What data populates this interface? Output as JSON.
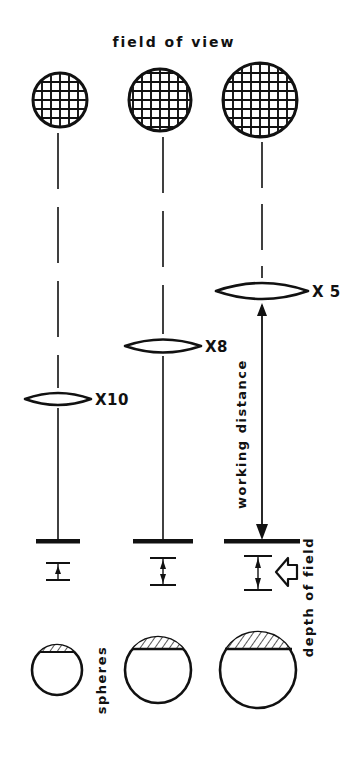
{
  "figure": {
    "title": "field of view",
    "background_color": "#ffffff",
    "ink_color": "#111111",
    "width": 349,
    "height": 758
  },
  "labels": {
    "field_of_view": "field of view",
    "working_distance": "working distance",
    "depth_of_field": "depth of field",
    "spheres": "spheres"
  },
  "columns": [
    {
      "magnification_label": "X10",
      "center_x": 58,
      "field_of_view": {
        "center_x": 60,
        "center_y": 100,
        "radius": 27,
        "grid_pitch": 9
      },
      "lens": {
        "center_x": 58,
        "center_y": 399,
        "half_width": 33,
        "half_height": 9
      },
      "specimen_bar": {
        "center_x": 58,
        "y": 541,
        "half_width": 22,
        "thickness": 4
      },
      "depth_of_field": {
        "center_x": 58,
        "top_y": 563,
        "bottom_y": 580,
        "cap_half_width": 12
      },
      "sphere": {
        "center_x": 57,
        "center_y": 670,
        "radius": 25,
        "cap_depth": 7
      }
    },
    {
      "magnification_label": "X8",
      "center_x": 163,
      "field_of_view": {
        "center_x": 160,
        "center_y": 100,
        "radius": 31,
        "grid_pitch": 9
      },
      "lens": {
        "center_x": 163,
        "center_y": 346,
        "half_width": 38,
        "half_height": 10
      },
      "specimen_bar": {
        "center_x": 163,
        "y": 541,
        "half_width": 30,
        "thickness": 4
      },
      "depth_of_field": {
        "center_x": 163,
        "top_y": 558,
        "bottom_y": 585,
        "cap_half_width": 13
      },
      "sphere": {
        "center_x": 158,
        "center_y": 670,
        "radius": 33,
        "cap_depth": 12
      }
    },
    {
      "magnification_label": "X 5",
      "center_x": 262,
      "field_of_view": {
        "center_x": 260,
        "center_y": 100,
        "radius": 37,
        "grid_pitch": 9
      },
      "lens": {
        "center_x": 262,
        "center_y": 291,
        "half_width": 46,
        "half_height": 12
      },
      "specimen_bar": {
        "center_x": 262,
        "y": 541,
        "half_width": 38,
        "thickness": 4
      },
      "depth_of_field": {
        "center_x": 258,
        "top_y": 556,
        "bottom_y": 590,
        "cap_half_width": 14
      },
      "sphere": {
        "center_x": 258,
        "center_y": 670,
        "radius": 38,
        "cap_depth": 17
      }
    }
  ],
  "annotations": {
    "working_distance_arrow": {
      "x": 262,
      "top_y": 305,
      "bottom_y": 538,
      "label_x": 246,
      "label_y": 430
    },
    "depth_of_field_pointer": {
      "tip_x": 276,
      "tip_y": 572,
      "label_x": 305,
      "label_y": 595
    },
    "spheres_label": {
      "x": 106,
      "y": 680
    }
  }
}
